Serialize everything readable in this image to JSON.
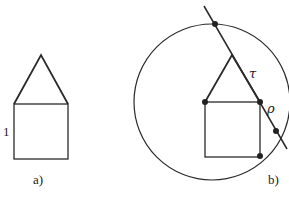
{
  "figure_a": {
    "caption": "a)",
    "side_label": "1"
  },
  "figure_b": {
    "caption": "b)",
    "label_tau": "τ",
    "label_rho": "ρ"
  },
  "colors": {
    "ink": "#2a2a2a",
    "background": "#ffffff"
  }
}
